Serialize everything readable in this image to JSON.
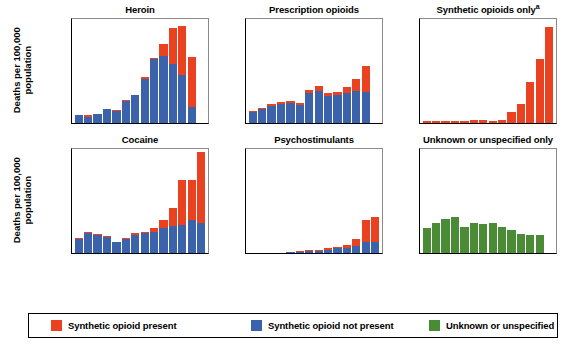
{
  "figure": {
    "y_axis_label": "Deaths per 100,000\npopulation",
    "x_axis_label": "Year",
    "y_ticks": [
      0,
      5,
      10
    ],
    "y_ticks_labels": [
      "0",
      "5",
      "10"
    ],
    "ylim": [
      0,
      14
    ],
    "x_tick_years": [
      "2005",
      "2008",
      "2011",
      "2014",
      "2017"
    ],
    "grid": false
  },
  "legend": {
    "position": "bottom",
    "items": [
      {
        "label": "Synthetic opioid present",
        "color": "#ea4120",
        "name": "synthetic-opioid-present"
      },
      {
        "label": "Synthetic opioid not present",
        "color": "#3a63ab",
        "name": "synthetic-opioid-not-present"
      },
      {
        "label": "Unknown or unspecified",
        "color": "#4a8b36",
        "name": "unknown-or-unspecified"
      }
    ]
  },
  "chart_data": [
    {
      "type": "bar",
      "id": "heroin",
      "title": "Heroin",
      "title_superscript": "",
      "xlabel": "Year",
      "ylabel": "Deaths per 100,000 population",
      "ylim": [
        0,
        14
      ],
      "stacked": true,
      "categories": [
        "2005",
        "2006",
        "2007",
        "2008",
        "2009",
        "2010",
        "2011",
        "2012",
        "2013",
        "2014",
        "2015",
        "2016",
        "2017",
        "2018"
      ],
      "series": [
        {
          "name": "Synthetic opioid not present",
          "color": "#3a63ab",
          "values": [
            1.0,
            0.85,
            1.2,
            1.85,
            1.65,
            2.9,
            3.7,
            5.8,
            8.4,
            8.8,
            7.8,
            6.3,
            2.1,
            0.0
          ]
        },
        {
          "name": "Synthetic opioid present",
          "color": "#ea4120",
          "values": [
            0.05,
            0.15,
            0.05,
            0.05,
            0.05,
            0.1,
            0.05,
            0.25,
            0.25,
            1.7,
            4.7,
            6.5,
            6.6,
            0.0
          ]
        }
      ],
      "totals": [
        1.05,
        1.0,
        1.25,
        1.9,
        1.7,
        3.0,
        3.75,
        6.05,
        8.65,
        10.5,
        12.5,
        12.8,
        8.7,
        0.0
      ]
    },
    {
      "type": "bar",
      "id": "prescription-opioids",
      "title": "Prescription opioids",
      "title_superscript": "",
      "xlabel": "Year",
      "ylabel": "Deaths per 100,000 population",
      "ylim": [
        0,
        14
      ],
      "stacked": true,
      "categories": [
        "2005",
        "2006",
        "2007",
        "2008",
        "2009",
        "2010",
        "2011",
        "2012",
        "2013",
        "2014",
        "2015",
        "2016",
        "2017",
        "2018"
      ],
      "series": [
        {
          "name": "Synthetic opioid not present",
          "color": "#3a63ab",
          "values": [
            1.5,
            1.9,
            2.2,
            2.5,
            2.7,
            2.4,
            3.9,
            4.2,
            3.6,
            3.7,
            3.9,
            4.2,
            4.1,
            0.0
          ]
        },
        {
          "name": "Synthetic opioid present",
          "color": "#ea4120",
          "values": [
            0.1,
            0.1,
            0.25,
            0.3,
            0.2,
            0.25,
            0.5,
            0.7,
            0.35,
            0.4,
            0.9,
            1.6,
            3.4,
            0.0
          ]
        }
      ],
      "totals": [
        1.6,
        2.0,
        2.45,
        2.8,
        2.9,
        2.65,
        4.4,
        4.9,
        3.95,
        4.1,
        4.8,
        5.8,
        7.5,
        0.0
      ]
    },
    {
      "type": "bar",
      "id": "synthetic-opioids-only",
      "title": "Synthetic opioids only",
      "title_superscript": "a",
      "xlabel": "Year",
      "ylabel": "Deaths per 100,000 population",
      "ylim": [
        0,
        14
      ],
      "stacked": false,
      "categories": [
        "2005",
        "2006",
        "2007",
        "2008",
        "2009",
        "2010",
        "2011",
        "2012",
        "2013",
        "2014",
        "2015",
        "2016",
        "2017",
        "2018"
      ],
      "series": [
        {
          "name": "Synthetic opioid present",
          "color": "#ea4120",
          "values": [
            0.3,
            0.3,
            0.3,
            0.25,
            0.3,
            0.35,
            0.4,
            0.25,
            0.4,
            1.4,
            2.5,
            5.4,
            8.5,
            12.7
          ]
        }
      ],
      "totals": [
        0.3,
        0.3,
        0.3,
        0.25,
        0.3,
        0.35,
        0.4,
        0.25,
        0.4,
        1.4,
        2.5,
        5.4,
        8.5,
        12.7
      ]
    },
    {
      "type": "bar",
      "id": "cocaine",
      "title": "Cocaine",
      "title_superscript": "",
      "xlabel": "Year",
      "ylabel": "Deaths per 100,000 population",
      "ylim": [
        0,
        14
      ],
      "stacked": true,
      "categories": [
        "2005",
        "2006",
        "2007",
        "2008",
        "2009",
        "2010",
        "2011",
        "2012",
        "2013",
        "2014",
        "2015",
        "2016",
        "2017",
        "2018"
      ],
      "series": [
        {
          "name": "Synthetic opioid not present",
          "color": "#3a63ab",
          "values": [
            1.9,
            2.6,
            2.4,
            2.1,
            1.45,
            1.9,
            2.4,
            2.7,
            2.8,
            3.3,
            3.6,
            3.7,
            4.3,
            4.0
          ]
        },
        {
          "name": "Synthetic opioid present",
          "color": "#ea4120",
          "values": [
            0.05,
            0.2,
            0.1,
            0.1,
            0.05,
            0.05,
            0.2,
            0.1,
            0.55,
            1.1,
            2.3,
            6.0,
            5.4,
            9.3
          ]
        }
      ],
      "totals": [
        1.95,
        2.8,
        2.5,
        2.2,
        1.5,
        1.95,
        2.6,
        2.8,
        3.35,
        4.4,
        5.9,
        9.7,
        9.7,
        13.3
      ]
    },
    {
      "type": "bar",
      "id": "psychostimulants",
      "title": "Psychostimulants",
      "title_superscript": "",
      "xlabel": "Year",
      "ylabel": "Deaths per 100,000 population",
      "ylim": [
        0,
        14
      ],
      "stacked": true,
      "categories": [
        "2005",
        "2006",
        "2007",
        "2008",
        "2009",
        "2010",
        "2011",
        "2012",
        "2013",
        "2014",
        "2015",
        "2016",
        "2017",
        "2018"
      ],
      "series": [
        {
          "name": "Synthetic opioid not present",
          "color": "#3a63ab",
          "values": [
            0.05,
            0.05,
            0.05,
            0.05,
            0.1,
            0.2,
            0.3,
            0.3,
            0.45,
            0.6,
            0.7,
            0.9,
            1.4,
            1.5
          ]
        },
        {
          "name": "Synthetic opioid present",
          "color": "#ea4120",
          "values": [
            0.0,
            0.0,
            0.0,
            0.0,
            0.0,
            0.05,
            0.05,
            0.1,
            0.15,
            0.25,
            0.4,
            1.0,
            2.9,
            3.2
          ]
        }
      ],
      "totals": [
        0.05,
        0.05,
        0.05,
        0.05,
        0.1,
        0.25,
        0.35,
        0.4,
        0.6,
        0.85,
        1.1,
        1.9,
        4.3,
        4.7
      ]
    },
    {
      "type": "bar",
      "id": "unknown-or-unspecified-only",
      "title": "Unknown or unspecified only",
      "title_superscript": "",
      "xlabel": "Year",
      "ylabel": "Deaths per 100,000 population",
      "ylim": [
        0,
        14
      ],
      "stacked": false,
      "categories": [
        "2005",
        "2006",
        "2007",
        "2008",
        "2009",
        "2010",
        "2011",
        "2012",
        "2013",
        "2014",
        "2015",
        "2016",
        "2017",
        "2018"
      ],
      "series": [
        {
          "name": "Unknown or unspecified",
          "color": "#4a8b36",
          "values": [
            3.3,
            4.0,
            4.5,
            4.7,
            3.4,
            3.9,
            3.8,
            4.0,
            3.5,
            3.1,
            2.5,
            2.4,
            2.4,
            0.0
          ]
        }
      ],
      "totals": [
        3.3,
        4.0,
        4.5,
        4.7,
        3.4,
        3.9,
        3.8,
        4.0,
        3.5,
        3.1,
        2.5,
        2.4,
        2.4,
        0.0
      ]
    }
  ]
}
